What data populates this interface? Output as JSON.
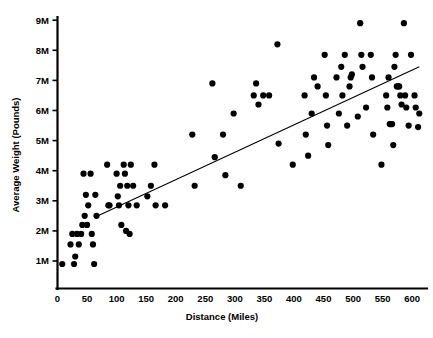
{
  "chart_data": {
    "type": "scatter",
    "title": "",
    "xlabel": "Distance (Miles)",
    "ylabel": "Average Weight (Pounds)",
    "xlim": [
      0,
      620
    ],
    "ylim": [
      0,
      9500000
    ],
    "xticks": [
      0,
      50,
      100,
      150,
      200,
      250,
      300,
      350,
      400,
      450,
      500,
      550,
      600
    ],
    "xticklabels": [
      "0",
      "50",
      "100",
      "150",
      "200",
      "250",
      "300",
      "350",
      "400",
      "450",
      "500",
      "550",
      "600"
    ],
    "yticks": [
      1000000,
      2000000,
      3000000,
      4000000,
      5000000,
      6000000,
      7000000,
      8000000,
      9000000
    ],
    "yticklabels": [
      "1M",
      "2M",
      "3M",
      "4M",
      "5M",
      "6M",
      "7M",
      "8M",
      "9M"
    ],
    "grid": false,
    "legend": false,
    "marker_color": "#000000",
    "marker_size": 3.1,
    "trendline": {
      "present": true,
      "color": "#000000",
      "x_start": 63,
      "y_start": 2450000,
      "x_end": 612,
      "y_end": 7450000
    },
    "points": [
      [
        8,
        900000
      ],
      [
        22,
        1550000
      ],
      [
        25,
        1900000
      ],
      [
        28,
        900000
      ],
      [
        30,
        1150000
      ],
      [
        33,
        1900000
      ],
      [
        36,
        1550000
      ],
      [
        40,
        1900000
      ],
      [
        42,
        2200000
      ],
      [
        44,
        3900000
      ],
      [
        46,
        2500000
      ],
      [
        48,
        3200000
      ],
      [
        50,
        2200000
      ],
      [
        52,
        2850000
      ],
      [
        56,
        3900000
      ],
      [
        58,
        1900000
      ],
      [
        60,
        1550000
      ],
      [
        62,
        900000
      ],
      [
        64,
        3200000
      ],
      [
        66,
        2500000
      ],
      [
        84,
        4200000
      ],
      [
        86,
        2850000
      ],
      [
        88,
        2850000
      ],
      [
        100,
        3900000
      ],
      [
        102,
        3150000
      ],
      [
        104,
        2850000
      ],
      [
        106,
        3500000
      ],
      [
        108,
        2200000
      ],
      [
        112,
        4200000
      ],
      [
        114,
        3900000
      ],
      [
        116,
        2000000
      ],
      [
        118,
        3500000
      ],
      [
        120,
        2850000
      ],
      [
        122,
        1900000
      ],
      [
        124,
        4200000
      ],
      [
        128,
        3500000
      ],
      [
        134,
        2850000
      ],
      [
        152,
        3150000
      ],
      [
        158,
        3500000
      ],
      [
        164,
        4200000
      ],
      [
        166,
        2850000
      ],
      [
        182,
        2850000
      ],
      [
        228,
        5200000
      ],
      [
        232,
        3500000
      ],
      [
        262,
        6900000
      ],
      [
        266,
        4450000
      ],
      [
        280,
        5200000
      ],
      [
        284,
        3850000
      ],
      [
        298,
        5900000
      ],
      [
        310,
        3500000
      ],
      [
        332,
        6500000
      ],
      [
        336,
        6900000
      ],
      [
        340,
        6200000
      ],
      [
        348,
        6500000
      ],
      [
        358,
        6500000
      ],
      [
        372,
        8200000
      ],
      [
        374,
        4900000
      ],
      [
        398,
        4200000
      ],
      [
        418,
        6500000
      ],
      [
        420,
        5200000
      ],
      [
        424,
        4500000
      ],
      [
        430,
        5900000
      ],
      [
        434,
        7100000
      ],
      [
        440,
        6800000
      ],
      [
        452,
        7850000
      ],
      [
        454,
        6500000
      ],
      [
        456,
        5500000
      ],
      [
        458,
        4850000
      ],
      [
        472,
        7100000
      ],
      [
        476,
        5900000
      ],
      [
        480,
        7450000
      ],
      [
        482,
        6500000
      ],
      [
        486,
        7850000
      ],
      [
        490,
        5500000
      ],
      [
        494,
        6800000
      ],
      [
        496,
        7100000
      ],
      [
        498,
        7200000
      ],
      [
        508,
        5800000
      ],
      [
        512,
        8900000
      ],
      [
        514,
        7850000
      ],
      [
        516,
        7450000
      ],
      [
        522,
        6100000
      ],
      [
        530,
        7850000
      ],
      [
        532,
        7100000
      ],
      [
        534,
        5200000
      ],
      [
        548,
        4200000
      ],
      [
        556,
        6500000
      ],
      [
        558,
        6100000
      ],
      [
        560,
        7100000
      ],
      [
        562,
        5550000
      ],
      [
        564,
        5550000
      ],
      [
        566,
        5550000
      ],
      [
        568,
        4850000
      ],
      [
        570,
        7450000
      ],
      [
        572,
        7850000
      ],
      [
        574,
        6800000
      ],
      [
        576,
        6800000
      ],
      [
        578,
        6800000
      ],
      [
        580,
        6500000
      ],
      [
        582,
        6200000
      ],
      [
        586,
        8900000
      ],
      [
        588,
        6500000
      ],
      [
        590,
        6100000
      ],
      [
        594,
        5500000
      ],
      [
        598,
        7850000
      ],
      [
        604,
        6500000
      ],
      [
        606,
        6100000
      ],
      [
        610,
        5450000
      ],
      [
        612,
        5900000
      ]
    ]
  },
  "chart": {
    "ylabel": "Average Weight (Pounds)",
    "xlabel": "Distance (Miles)"
  }
}
